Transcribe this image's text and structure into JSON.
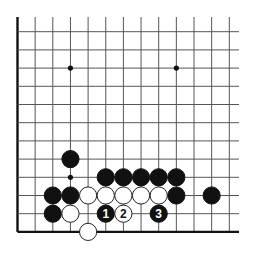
{
  "diagram": {
    "type": "go-board-fragment",
    "grid": {
      "columns": 13,
      "rows": 12,
      "origin_x": 17.5,
      "origin_y": 31.7,
      "spacing_x": 17.65,
      "spacing_y": 18.2,
      "top_extend": 17,
      "right_extend": 239,
      "left_edge_is_border": true,
      "bottom_edge_is_border": true,
      "line_color": "#555555",
      "border_color": "#111111"
    },
    "hoshi": [
      {
        "c": 3,
        "r": 2
      },
      {
        "c": 9,
        "r": 2
      },
      {
        "c": 3,
        "r": 8
      }
    ],
    "stones": [
      {
        "c": 3,
        "r": 7,
        "color": "black",
        "label": ""
      },
      {
        "c": 5,
        "r": 8,
        "color": "black",
        "label": ""
      },
      {
        "c": 6,
        "r": 8,
        "color": "black",
        "label": ""
      },
      {
        "c": 7,
        "r": 8,
        "color": "black",
        "label": ""
      },
      {
        "c": 8,
        "r": 8,
        "color": "black",
        "label": ""
      },
      {
        "c": 9,
        "r": 8,
        "color": "black",
        "label": ""
      },
      {
        "c": 2,
        "r": 9,
        "color": "black",
        "label": ""
      },
      {
        "c": 3,
        "r": 9,
        "color": "black",
        "label": ""
      },
      {
        "c": 4,
        "r": 9,
        "color": "white",
        "label": ""
      },
      {
        "c": 5,
        "r": 9,
        "color": "white",
        "label": ""
      },
      {
        "c": 6,
        "r": 9,
        "color": "white",
        "label": ""
      },
      {
        "c": 7,
        "r": 9,
        "color": "white",
        "label": ""
      },
      {
        "c": 8,
        "r": 9,
        "color": "white",
        "label": ""
      },
      {
        "c": 9,
        "r": 9,
        "color": "black",
        "label": ""
      },
      {
        "c": 11,
        "r": 9,
        "color": "black",
        "label": ""
      },
      {
        "c": 2,
        "r": 10,
        "color": "black",
        "label": ""
      },
      {
        "c": 3,
        "r": 10,
        "color": "white",
        "label": ""
      },
      {
        "c": 5,
        "r": 10,
        "color": "black",
        "label": "1"
      },
      {
        "c": 6,
        "r": 10,
        "color": "white",
        "label": "2"
      },
      {
        "c": 8,
        "r": 10,
        "color": "black",
        "label": "3"
      },
      {
        "c": 4,
        "r": 11,
        "color": "white",
        "label": ""
      }
    ],
    "colors": {
      "black_stone": "#111111",
      "white_stone": "#ffffff",
      "white_stroke": "#222222"
    }
  }
}
